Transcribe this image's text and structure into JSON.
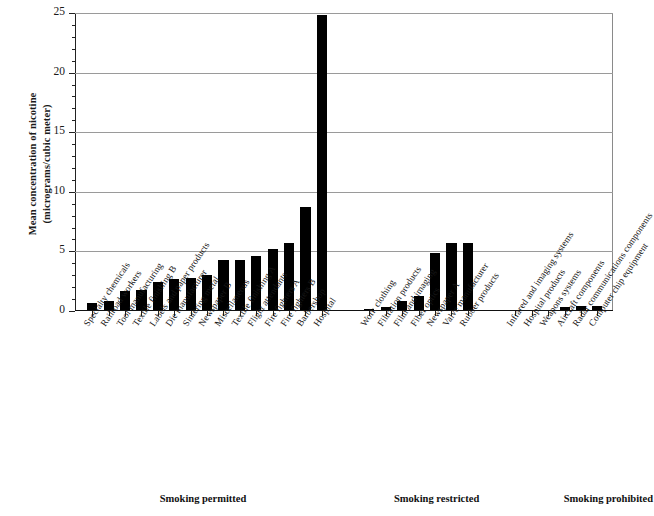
{
  "chart_data": {
    "type": "bar",
    "title": "",
    "xlabel": "",
    "ylabel_line1": "Mean concentration of nicotine",
    "ylabel_line2": "(micrograms/cubic meter)",
    "ylim": [
      0,
      25
    ],
    "ytick_labels": [
      "0",
      "5",
      "10",
      "15",
      "20",
      "25"
    ],
    "ytick_values": [
      0,
      5,
      10,
      15,
      20,
      25
    ],
    "yminor_step": 1,
    "grid": "horizontal-major",
    "legend": "none",
    "panels": [
      {
        "caption": "Smoking permitted",
        "categories": [
          "Specialty chemicals",
          "Railroad workers",
          "Tool manufacturing",
          "Textile finishing B",
          "Labels and paper products",
          "Die manufacturer",
          "Sintering metal",
          "Newspaper B",
          "Miscellaneous",
          "Textile finishing A",
          "Flight attendants",
          "Fire fighters A",
          "Fire fighters B",
          "Barbershop",
          "Hospital"
        ],
        "values": [
          0.7,
          0.8,
          1.7,
          1.8,
          2.4,
          2.7,
          2.8,
          3.0,
          4.3,
          4.3,
          4.6,
          5.2,
          5.7,
          8.7,
          24.8
        ]
      },
      {
        "caption": "Smoking restricted",
        "categories": [
          "Work clothing",
          "Filtration products",
          "Film and imaging",
          "Fiber optics",
          "Newspaper A",
          "Valve manufacturer",
          "Rubber products"
        ],
        "values": [
          0.15,
          0.35,
          0.8,
          1.3,
          4.9,
          5.7,
          5.7
        ]
      },
      {
        "caption": "Smoking prohibited",
        "categories": [
          "Infrared and imaging systems",
          "Hospital products",
          "Weapons systems",
          "Aircraft components",
          "Radar communications components",
          "Computer chip equipment"
        ],
        "values": [
          0.04,
          0.1,
          0.12,
          0.3,
          0.4,
          0.45
        ]
      }
    ],
    "bar_color": "#000000",
    "background_color": "#ffffff",
    "grid_color": "#9a9a9a"
  }
}
